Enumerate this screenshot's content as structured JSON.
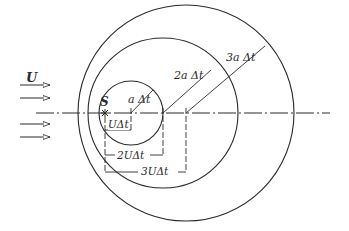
{
  "diagram": {
    "title": "",
    "type": "wavefronts from moving point source",
    "colors": {
      "stroke": "#2a2a2a",
      "background": "#ffffff"
    },
    "flow": {
      "label": "U",
      "arrow_count": 4
    },
    "source": {
      "label": "S"
    },
    "radii_labels": [
      "a Δt",
      "2a Δt",
      "3a Δt"
    ],
    "displacement_labels": [
      "UΔt",
      "2UΔt",
      "3UΔt"
    ],
    "circles": [
      {
        "cx": 131,
        "cy": 113,
        "r": 32
      },
      {
        "cx": 163,
        "cy": 113,
        "r": 75
      },
      {
        "cx": 186,
        "cy": 113,
        "r": 108
      }
    ]
  }
}
